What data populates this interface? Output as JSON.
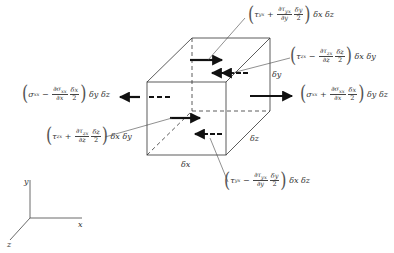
{
  "diagram": {
    "element_dimensions": {
      "dx": "δx",
      "dy": "δy",
      "dz": "δz"
    },
    "axes": {
      "x": "x",
      "y": "y",
      "z": "z"
    },
    "labels": {
      "tau_yx_top": {
        "term": "τ",
        "sub": "yx",
        "sign": "+",
        "num": "∂τ",
        "num_sub": "yx",
        "den": "∂y",
        "half_num": "δy",
        "half_den": "2",
        "area": "δx δz"
      },
      "tau_zx_back": {
        "term": "τ",
        "sub": "zx",
        "sign": "−",
        "num": "∂τ",
        "num_sub": "zx",
        "den": "∂z",
        "half_num": "δz",
        "half_den": "2",
        "area": "δx δy"
      },
      "sigma_xx_left": {
        "term": "σ",
        "sub": "xx",
        "sign": "−",
        "num": "∂σ",
        "num_sub": "xx",
        "den": "∂x",
        "half_num": "δx",
        "half_den": "2",
        "area": "δy δz"
      },
      "sigma_xx_right": {
        "term": "σ",
        "sub": "xx",
        "sign": "+",
        "num": "∂σ",
        "num_sub": "xx",
        "den": "∂x",
        "half_num": "δx",
        "half_den": "2",
        "area": "δy δz"
      },
      "tau_zx_front": {
        "term": "τ",
        "sub": "zx",
        "sign": "+",
        "num": "∂τ",
        "num_sub": "zx",
        "den": "∂z",
        "half_num": "δz",
        "half_den": "2",
        "area": "δx δy"
      },
      "tau_yx_bottom": {
        "term": "τ",
        "sub": "yx",
        "sign": "−",
        "num": "∂τ",
        "num_sub": "yx",
        "den": "∂y",
        "half_num": "δy",
        "half_den": "2",
        "area": "δx δz"
      }
    }
  }
}
